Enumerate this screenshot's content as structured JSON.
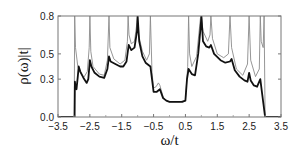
{
  "chart_data": {
    "type": "line",
    "title": "",
    "xlabel": "ω/t",
    "ylabel": "ρ(ω)|t|",
    "xlim": [
      -3.5,
      3.5
    ],
    "ylim": [
      0.0,
      0.8
    ],
    "xticks": [
      -3.5,
      -2.5,
      -1.5,
      -0.5,
      0.5,
      1.5,
      2.5,
      3.5
    ],
    "xtick_labels": [
      "-3.5",
      "-2.5",
      "-1.5",
      "-0.5",
      "0.5",
      "1.5",
      "2.5",
      "3.5"
    ],
    "yticks": [
      0.0,
      0.3,
      0.5,
      0.8
    ],
    "ytick_labels": [
      "0.0",
      "0.3",
      "0.5",
      "0.8"
    ],
    "grid": false,
    "legend": null,
    "series": [
      {
        "name": "thick (black) curve",
        "color": "#111111",
        "x": [
          -3.5,
          -2.98,
          -2.97,
          -2.95,
          -2.92,
          -2.88,
          -2.85,
          -2.8,
          -2.7,
          -2.6,
          -2.55,
          -2.5,
          -2.45,
          -2.35,
          -2.2,
          -2.05,
          -1.95,
          -1.9,
          -1.85,
          -1.7,
          -1.55,
          -1.45,
          -1.35,
          -1.28,
          -1.2,
          -1.1,
          -1.02,
          -1.0,
          -0.95,
          -0.85,
          -0.75,
          -0.65,
          -0.6,
          -0.55,
          -0.5,
          -0.4,
          -0.3,
          -0.2,
          -0.1,
          0.0,
          0.2,
          0.4,
          0.5,
          0.55,
          0.6,
          0.7,
          0.8,
          0.9,
          0.98,
          1.0,
          1.05,
          1.15,
          1.25,
          1.3,
          1.4,
          1.6,
          1.75,
          1.9,
          1.95,
          2.05,
          2.2,
          2.35,
          2.45,
          2.5,
          2.55,
          2.65,
          2.75,
          2.85,
          2.9,
          2.95,
          3.0,
          3.5
        ],
        "y": [
          0.0,
          0.0,
          0.28,
          0.24,
          0.22,
          0.32,
          0.4,
          0.36,
          0.31,
          0.27,
          0.3,
          0.45,
          0.4,
          0.35,
          0.32,
          0.31,
          0.38,
          0.48,
          0.44,
          0.42,
          0.4,
          0.4,
          0.44,
          0.57,
          0.53,
          0.55,
          0.68,
          0.8,
          0.6,
          0.48,
          0.43,
          0.41,
          0.4,
          0.3,
          0.2,
          0.2,
          0.22,
          0.15,
          0.13,
          0.12,
          0.12,
          0.12,
          0.13,
          0.3,
          0.38,
          0.34,
          0.33,
          0.5,
          0.72,
          0.8,
          0.6,
          0.56,
          0.55,
          0.57,
          0.5,
          0.45,
          0.43,
          0.44,
          0.46,
          0.37,
          0.32,
          0.29,
          0.28,
          0.35,
          0.29,
          0.25,
          0.24,
          0.3,
          0.2,
          0.1,
          0.0,
          0.0
        ]
      },
      {
        "name": "thin (gray) curve",
        "color": "#8a8a8a",
        "x": [
          -3.5,
          -2.99,
          -2.975,
          -2.95,
          -2.88,
          -2.8,
          -2.7,
          -2.58,
          -2.52,
          -2.5,
          -2.47,
          -2.4,
          -2.2,
          -2.05,
          -1.95,
          -1.9,
          -1.87,
          -1.75,
          -1.55,
          -1.4,
          -1.32,
          -1.3,
          -1.27,
          -1.2,
          -1.1,
          -1.02,
          -1.0,
          -0.97,
          -0.85,
          -0.72,
          -0.63,
          -0.6,
          -0.55,
          -0.5,
          -0.42,
          -0.35,
          -0.3,
          -0.2,
          -0.1,
          0.0,
          0.3,
          0.5,
          0.57,
          0.6,
          0.63,
          0.7,
          0.85,
          0.97,
          1.0,
          1.05,
          1.2,
          1.27,
          1.3,
          1.35,
          1.5,
          1.7,
          1.85,
          1.9,
          1.95,
          2.1,
          2.3,
          2.45,
          2.5,
          2.55,
          2.7,
          2.82,
          2.85,
          2.88,
          2.94,
          2.97,
          3.0,
          3.5
        ],
        "y": [
          0.0,
          0.0,
          0.8,
          0.55,
          0.4,
          0.35,
          0.31,
          0.36,
          0.55,
          0.8,
          0.52,
          0.4,
          0.34,
          0.33,
          0.45,
          0.8,
          0.55,
          0.46,
          0.42,
          0.45,
          0.6,
          0.8,
          0.65,
          0.58,
          0.6,
          0.75,
          0.8,
          0.65,
          0.52,
          0.45,
          0.5,
          0.8,
          0.35,
          0.23,
          0.24,
          0.27,
          0.25,
          0.16,
          0.13,
          0.12,
          0.12,
          0.13,
          0.4,
          0.8,
          0.5,
          0.4,
          0.48,
          0.78,
          0.8,
          0.68,
          0.6,
          0.65,
          0.8,
          0.62,
          0.5,
          0.47,
          0.5,
          0.8,
          0.55,
          0.38,
          0.33,
          0.42,
          0.8,
          0.45,
          0.32,
          0.38,
          0.8,
          0.6,
          0.55,
          0.8,
          0.0,
          0.0
        ]
      }
    ]
  }
}
